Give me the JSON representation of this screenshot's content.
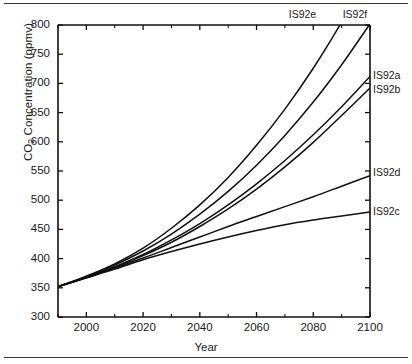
{
  "figure": {
    "top_rule": "horizontal-rule",
    "bottom_rule": "horizontal-rule"
  },
  "chart_data": {
    "type": "line",
    "title": "",
    "xlabel": "Year",
    "ylabel": "CO2 Concentration (ppmv)",
    "ylabel_prefix": "CO",
    "ylabel_sub": "2",
    "ylabel_suffix": " Concentration (ppmv)",
    "xlim": [
      1990,
      2100
    ],
    "ylim": [
      300,
      800
    ],
    "grid": false,
    "legend_position": "right-inline-labels",
    "xticks": [
      2000,
      2020,
      2040,
      2060,
      2080,
      2100
    ],
    "xticks_minor": [
      1990,
      2010,
      2030,
      2050,
      2070,
      2090
    ],
    "yticks": [
      300,
      350,
      400,
      450,
      500,
      550,
      600,
      650,
      700,
      750,
      800
    ],
    "x": [
      1990,
      2000,
      2010,
      2020,
      2030,
      2040,
      2050,
      2060,
      2070,
      2080,
      2090,
      2100
    ],
    "series": [
      {
        "name": "IS92a",
        "label": "IS92a",
        "color": "#101010",
        "label_y_ppmv": 715,
        "values": [
          352,
          368,
          386,
          407,
          432,
          460,
          492,
          528,
          568,
          612,
          660,
          712
        ]
      },
      {
        "name": "IS92b",
        "label": "IS92b",
        "color": "#101010",
        "label_y_ppmv": 690,
        "values": [
          352,
          368,
          385,
          405,
          428,
          455,
          485,
          519,
          557,
          599,
          645,
          692
        ]
      },
      {
        "name": "IS92c",
        "label": "IS92c",
        "color": "#101010",
        "label_y_ppmv": 482,
        "values": [
          352,
          367,
          382,
          398,
          412,
          425,
          437,
          448,
          458,
          466,
          473,
          480
        ]
      },
      {
        "name": "IS92d",
        "label": "IS92d",
        "color": "#101010",
        "label_y_ppmv": 548,
        "values": [
          352,
          367,
          384,
          401,
          419,
          437,
          455,
          472,
          489,
          506,
          524,
          542
        ]
      },
      {
        "name": "IS92e",
        "label": "IS92e",
        "color": "#101010",
        "label_y_ppmv": 830,
        "label_x_year": 2077,
        "values": [
          352,
          370,
          391,
          418,
          452,
          492,
          539,
          594,
          656,
          726,
          805,
          892
        ]
      },
      {
        "name": "IS92f",
        "label": "IS92f",
        "color": "#101010",
        "label_y_ppmv": 830,
        "label_x_year": 2096,
        "values": [
          352,
          369,
          389,
          413,
          442,
          476,
          515,
          560,
          611,
          668,
          732,
          802
        ]
      }
    ]
  }
}
